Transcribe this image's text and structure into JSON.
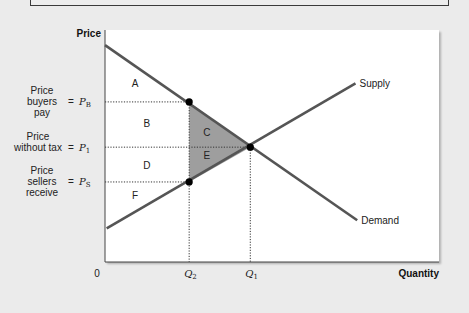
{
  "chart_data": {
    "type": "line",
    "title": "",
    "xlabel": "Quantity",
    "ylabel": "Price",
    "origin_label": "0",
    "xlim": [
      0,
      10
    ],
    "ylim": [
      0,
      10
    ],
    "series": [
      {
        "name": "Supply",
        "label": "Supply",
        "points": [
          [
            0.05,
            1.45
          ],
          [
            7.5,
            7.7
          ]
        ]
      },
      {
        "name": "Demand",
        "label": "Demand",
        "points": [
          [
            0.0,
            9.35
          ],
          [
            7.55,
            1.8
          ]
        ]
      }
    ],
    "points": [
      {
        "name": "buyers-price-point",
        "x": 2.52,
        "y": 6.9
      },
      {
        "name": "equilibrium-point",
        "x": 4.35,
        "y": 4.95
      },
      {
        "name": "sellers-price-point",
        "x": 2.52,
        "y": 3.45
      }
    ],
    "price_levels": [
      {
        "id": "PB",
        "symbol": "P",
        "subscript": "B",
        "value": 6.9,
        "label_lines": [
          "Price",
          "buyers",
          "pay"
        ]
      },
      {
        "id": "P1",
        "symbol": "P",
        "subscript": "1",
        "value": 4.95,
        "label_lines": [
          "Price",
          "without tax"
        ]
      },
      {
        "id": "PS",
        "symbol": "P",
        "subscript": "S",
        "value": 3.45,
        "label_lines": [
          "Price",
          "sellers",
          "receive"
        ]
      }
    ],
    "quantity_levels": [
      {
        "id": "Q2",
        "symbol": "Q",
        "subscript": "2",
        "value": 2.52
      },
      {
        "id": "Q1",
        "symbol": "Q",
        "subscript": "1",
        "value": 4.35
      }
    ],
    "regions": [
      {
        "label": "A",
        "x": 0.9,
        "y": 7.7
      },
      {
        "label": "B",
        "x": 1.25,
        "y": 5.95
      },
      {
        "label": "C",
        "x": 3.05,
        "y": 5.6
      },
      {
        "label": "D",
        "x": 1.25,
        "y": 4.15
      },
      {
        "label": "E",
        "x": 3.05,
        "y": 4.6
      },
      {
        "label": "F",
        "x": 0.9,
        "y": 2.85
      }
    ],
    "shaded_region": {
      "label": "deadweight-loss",
      "vertices": [
        [
          2.52,
          6.9
        ],
        [
          4.35,
          4.95
        ],
        [
          2.52,
          3.45
        ]
      ],
      "color": "#9e9e9e"
    },
    "equals_sign": "="
  }
}
